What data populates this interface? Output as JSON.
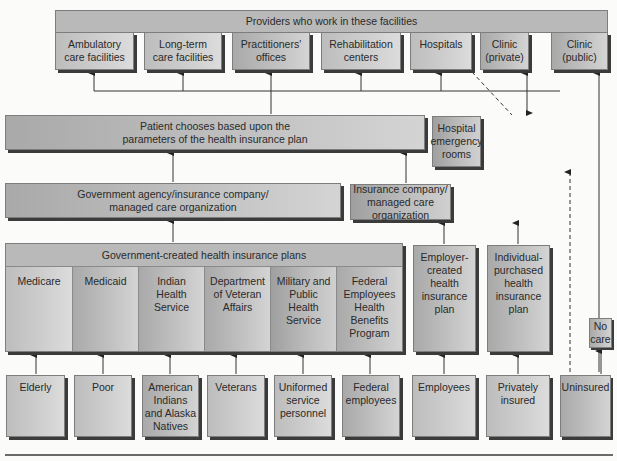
{
  "providers": {
    "title": "Providers who work in these facilities",
    "facilities": [
      {
        "label": "Ambulatory\ncare facilities"
      },
      {
        "label": "Long-term\ncare facilities"
      },
      {
        "label": "Practitioners'\noffices"
      },
      {
        "label": "Rehabilitation\ncenters"
      },
      {
        "label": "Hospitals"
      },
      {
        "label": "Clinic\n(private)"
      },
      {
        "label": "Clinic\n(public)"
      }
    ]
  },
  "patient_choice": {
    "label": "Patient chooses based upon the\nparameters of the health insurance plan"
  },
  "hospital_er": {
    "label": "Hospital\nemergency\nrooms"
  },
  "gov_agency": {
    "label": "Government agency/insurance company/\nmanaged care organization"
  },
  "insurance_company": {
    "label": "Insurance company/\nmanaged care organization"
  },
  "gov_plans": {
    "title": "Government-created health insurance plans",
    "plans": [
      {
        "label": "Medicare"
      },
      {
        "label": "Medicaid"
      },
      {
        "label": "Indian\nHealth\nService"
      },
      {
        "label": "Department\nof Veteran\nAffairs"
      },
      {
        "label": "Military and\nPublic\nHealth\nService"
      },
      {
        "label": "Federal\nEmployees\nHealth\nBenefits\nProgram"
      }
    ]
  },
  "private_plans": [
    {
      "label": "Employer-\ncreated\nhealth\ninsurance\nplan"
    },
    {
      "label": "Individual-\npurchased\nhealth\ninsurance\nplan"
    }
  ],
  "no_care": {
    "label": "No\ncare"
  },
  "populations": [
    {
      "label": "Elderly"
    },
    {
      "label": "Poor"
    },
    {
      "label": "American\nIndians\nand Alaska\nNatives"
    },
    {
      "label": "Veterans"
    },
    {
      "label": "Uniformed\nservice\npersonnel"
    },
    {
      "label": "Federal\nemployees"
    },
    {
      "label": "Employees"
    },
    {
      "label": "Privately\ninsured"
    },
    {
      "label": "Uninsured"
    }
  ]
}
